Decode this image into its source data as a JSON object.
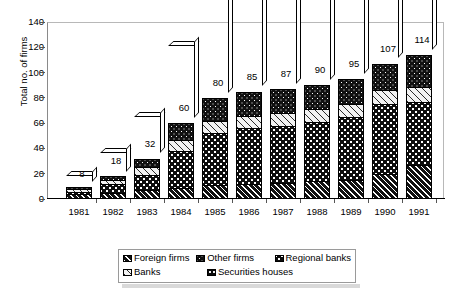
{
  "chart_data": {
    "type": "bar",
    "subtype": "stacked-bar-3d",
    "title": "",
    "xlabel": "",
    "ylabel": "Total no. of firms",
    "ylim": [
      0,
      140
    ],
    "ytick_step": 20,
    "yticks": [
      140,
      120,
      100,
      80,
      60,
      40,
      20,
      0
    ],
    "grid": true,
    "grid_axis": "y",
    "grid_style": "dotted",
    "legend_position": "bottom",
    "categories": [
      "1981",
      "1982",
      "1983",
      "1984",
      "1985",
      "1986",
      "1987",
      "1988",
      "1989",
      "1990",
      "1991"
    ],
    "totals": [
      8,
      18,
      32,
      60,
      80,
      85,
      87,
      90,
      95,
      107,
      114
    ],
    "data_labels": [
      "8",
      "18",
      "32",
      "60",
      "80",
      "85",
      "87",
      "90",
      "95",
      "107",
      "114"
    ],
    "series": [
      {
        "name": "Foreign firms",
        "pattern": "dark-diagonal-hatch",
        "color": "#111111",
        "values": [
          4,
          5,
          7,
          9,
          11,
          12,
          13,
          14,
          15,
          20,
          27
        ]
      },
      {
        "name": "Regional banks",
        "pattern": "dark-dotted",
        "color": "#0d0d0d",
        "values": [
          1,
          7,
          12,
          29,
          41,
          44,
          45,
          47,
          50,
          55,
          50
        ]
      },
      {
        "name": "Banks",
        "pattern": "light-diagonal-hatch",
        "color": "#f2f2f2",
        "values": [
          2,
          3,
          6,
          9,
          10,
          10,
          10,
          10,
          10,
          11,
          12
        ]
      },
      {
        "name": "Other firms",
        "pattern": "dark-dotted-coarse",
        "color": "#111111",
        "values": [
          1,
          3,
          7,
          13,
          18,
          19,
          19,
          19,
          20,
          21,
          25
        ]
      },
      {
        "name": "Securities houses",
        "pattern": "dark-fine-dotted",
        "color": "#0a0a0a",
        "values": [
          0,
          0,
          0,
          0,
          0,
          0,
          0,
          0,
          0,
          0,
          0
        ]
      }
    ]
  },
  "axis": {
    "y_title": "Total no. of firms",
    "y_tick_labels": [
      "140",
      "120",
      "100",
      "80",
      "60",
      "40",
      "20",
      "0"
    ],
    "x_tick_labels": [
      "1981",
      "1982",
      "1983",
      "1984",
      "1985",
      "1986",
      "1987",
      "1988",
      "1989",
      "1990",
      "1991"
    ]
  },
  "legend": {
    "row1": [
      {
        "label": "Foreign firms",
        "swatch": "dark-diagonal-hatch"
      },
      {
        "label": "Other firms",
        "swatch": "dark-dotted-coarse"
      },
      {
        "label": "Regional banks",
        "swatch": "dark-dotted"
      }
    ],
    "row2": [
      {
        "label": "Banks",
        "swatch": "light-diagonal-hatch"
      },
      {
        "label": "Securities houses",
        "swatch": "dark-fine-dotted"
      }
    ]
  },
  "colors": {
    "background": "#ffffff",
    "ink": "#000000",
    "gridline": "#8f8f8f",
    "frame": "#b8b8b8",
    "legend_border": "#9a9a9a",
    "legend_shadow": "#d9d9d9"
  }
}
